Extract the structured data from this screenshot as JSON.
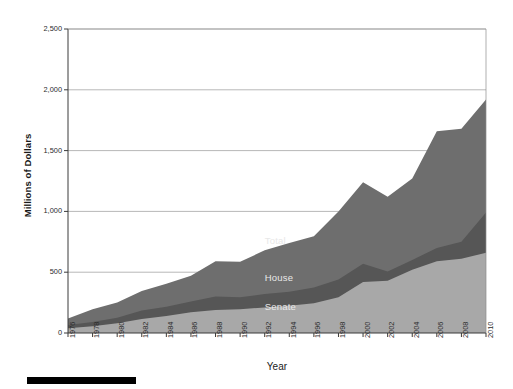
{
  "chart_data": {
    "type": "area",
    "title": "",
    "xlabel": "Year",
    "ylabel": "Millions of Dollars",
    "xlim": [
      1976,
      2010
    ],
    "ylim": [
      0,
      2500
    ],
    "yticks": [
      0,
      500,
      1000,
      1500,
      2000,
      2500
    ],
    "ytick_labels": [
      "0",
      "500",
      "1,000",
      "1,500",
      "2,000",
      "2,500"
    ],
    "grid": "horizontal",
    "legend_position": "inline-annotations",
    "stacked": false,
    "x": [
      1976,
      1978,
      1980,
      1982,
      1984,
      1986,
      1988,
      1990,
      1992,
      1994,
      1996,
      1998,
      2000,
      2002,
      2004,
      2006,
      2008,
      2010
    ],
    "xtick_labels": [
      "1976",
      "1978",
      "1980",
      "1982",
      "1984",
      "1986",
      "1988",
      "1990",
      "1992",
      "1994",
      "1996",
      "1998",
      "2000",
      "2002",
      "2004",
      "2006",
      "2008",
      "2010"
    ],
    "series": [
      {
        "name": "Total",
        "color": "#6e6e6e",
        "values": [
          120,
          195,
          250,
          345,
          405,
          470,
          590,
          585,
          680,
          740,
          795,
          1000,
          1240,
          1120,
          1270,
          1660,
          1680,
          1920
        ]
      },
      {
        "name": "House",
        "color": "#565656",
        "values": [
          65,
          90,
          125,
          185,
          215,
          260,
          300,
          295,
          320,
          340,
          375,
          440,
          570,
          505,
          600,
          700,
          750,
          990
        ]
      },
      {
        "name": "Senate",
        "color": "#a8a8a8",
        "values": [
          40,
          55,
          80,
          115,
          140,
          170,
          190,
          195,
          210,
          225,
          245,
          295,
          420,
          430,
          520,
          590,
          610,
          660
        ]
      }
    ],
    "annotations": [
      {
        "text": "Total",
        "x": 1992,
        "y": 760
      },
      {
        "text": "House",
        "x": 1992,
        "y": 450
      },
      {
        "text": "Senate",
        "x": 1992,
        "y": 215
      }
    ]
  }
}
